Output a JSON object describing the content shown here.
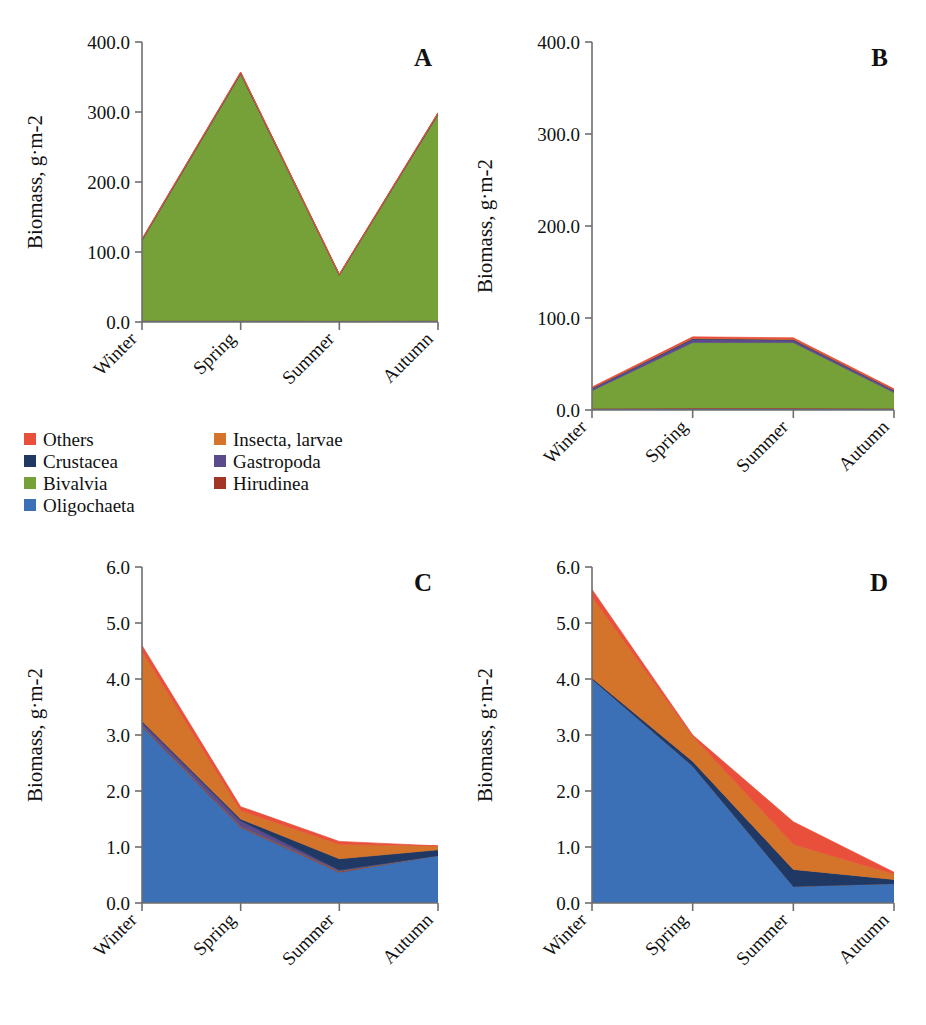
{
  "figure": {
    "kind": "multi-panel-stacked-area-figure",
    "panel_count": 4,
    "y_axis_title": "Biomass, g·m-2",
    "categories": [
      "Winter",
      "Spring",
      "Summer",
      "Autumn"
    ]
  },
  "legend": {
    "position": "center-left, between top and bottom panel rows",
    "columns": 2,
    "items": [
      {
        "label": "Others",
        "color": "#E8503C"
      },
      {
        "label": "Insecta, larvae",
        "color": "#D4742B"
      },
      {
        "label": "Crustacea",
        "color": "#1F3864"
      },
      {
        "label": "Gastropoda",
        "color": "#5B4A8C"
      },
      {
        "label": "Bivalvia",
        "color": "#76A038"
      },
      {
        "label": "Hirudinea",
        "color": "#A33527"
      },
      {
        "label": "Oligochaeta",
        "color": "#3B6FB6"
      }
    ]
  },
  "panels": [
    {
      "id": "A",
      "letter": "A"
    },
    {
      "id": "B",
      "letter": "B"
    },
    {
      "id": "C",
      "letter": "C"
    },
    {
      "id": "D",
      "letter": "D"
    }
  ],
  "chart_data": [
    {
      "panel": "A",
      "type": "area",
      "stacked": true,
      "title": "A",
      "xlabel": "",
      "ylabel": "Biomass, g·m-2",
      "categories": [
        "Winter",
        "Spring",
        "Summer",
        "Autumn"
      ],
      "ylim": [
        0,
        400
      ],
      "yticks": [
        0,
        100,
        200,
        300,
        400
      ],
      "ytick_labels": [
        "0.0",
        "100.0",
        "200.0",
        "300.0",
        "400.0"
      ],
      "grid": false,
      "legend_shared": true,
      "series": [
        {
          "name": "Oligochaeta",
          "color": "#3B6FB6",
          "values": [
            2.0,
            2.0,
            1.5,
            2.0
          ]
        },
        {
          "name": "Hirudinea",
          "color": "#A33527",
          "values": [
            0.3,
            0.3,
            0.2,
            0.3
          ]
        },
        {
          "name": "Bivalvia",
          "color": "#76A038",
          "values": [
            114.0,
            352.0,
            65.0,
            294.0
          ]
        },
        {
          "name": "Gastropoda",
          "color": "#5B4A8C",
          "values": [
            1.2,
            1.5,
            0.8,
            1.5
          ]
        },
        {
          "name": "Crustacea",
          "color": "#1F3864",
          "values": [
            0.3,
            0.3,
            0.2,
            0.3
          ]
        },
        {
          "name": "Insecta, larvae",
          "color": "#D4742B",
          "values": [
            0.6,
            0.6,
            0.4,
            0.6
          ]
        },
        {
          "name": "Others",
          "color": "#E8503C",
          "values": [
            0.3,
            0.3,
            0.2,
            0.3
          ]
        }
      ],
      "totals": [
        118.7,
        357.0,
        68.3,
        298.7
      ]
    },
    {
      "panel": "B",
      "type": "area",
      "stacked": true,
      "title": "B",
      "xlabel": "",
      "ylabel": "Biomass, g·m-2",
      "categories": [
        "Winter",
        "Spring",
        "Summer",
        "Autumn"
      ],
      "ylim": [
        0,
        400
      ],
      "yticks": [
        0,
        100,
        200,
        300,
        400
      ],
      "ytick_labels": [
        "0.0",
        "100.0",
        "200.0",
        "300.0",
        "400.0"
      ],
      "grid": false,
      "legend_shared": true,
      "series": [
        {
          "name": "Oligochaeta",
          "color": "#3B6FB6",
          "values": [
            1.5,
            1.5,
            1.5,
            1.5
          ]
        },
        {
          "name": "Hirudinea",
          "color": "#A33527",
          "values": [
            0.5,
            0.8,
            0.8,
            0.5
          ]
        },
        {
          "name": "Bivalvia",
          "color": "#76A038",
          "values": [
            19.0,
            71.0,
            71.0,
            17.0
          ]
        },
        {
          "name": "Gastropoda",
          "color": "#5B4A8C",
          "values": [
            2.5,
            4.0,
            3.0,
            2.5
          ]
        },
        {
          "name": "Crustacea",
          "color": "#1F3864",
          "values": [
            0.3,
            0.4,
            0.4,
            0.3
          ]
        },
        {
          "name": "Insecta, larvae",
          "color": "#D4742B",
          "values": [
            0.4,
            0.6,
            0.6,
            0.4
          ]
        },
        {
          "name": "Others",
          "color": "#E8503C",
          "values": [
            0.8,
            1.2,
            1.2,
            0.8
          ]
        }
      ],
      "totals": [
        25.0,
        79.5,
        78.5,
        23.0
      ]
    },
    {
      "panel": "C",
      "type": "area",
      "stacked": true,
      "title": "C",
      "xlabel": "",
      "ylabel": "Biomass, g·m-2",
      "categories": [
        "Winter",
        "Spring",
        "Summer",
        "Autumn"
      ],
      "ylim": [
        0,
        6
      ],
      "yticks": [
        0,
        1,
        2,
        3,
        4,
        5,
        6
      ],
      "ytick_labels": [
        "0.0",
        "1.0",
        "2.0",
        "3.0",
        "4.0",
        "5.0",
        "6.0"
      ],
      "grid": false,
      "legend_shared": true,
      "series": [
        {
          "name": "Oligochaeta",
          "color": "#3B6FB6",
          "values": [
            3.15,
            1.35,
            0.55,
            0.85
          ]
        },
        {
          "name": "Hirudinea",
          "color": "#A33527",
          "values": [
            0.02,
            0.02,
            0.02,
            0.0
          ]
        },
        {
          "name": "Bivalvia",
          "color": "#76A038",
          "values": [
            0.0,
            0.0,
            0.0,
            0.0
          ]
        },
        {
          "name": "Gastropoda",
          "color": "#5B4A8C",
          "values": [
            0.06,
            0.1,
            0.02,
            0.0
          ]
        },
        {
          "name": "Crustacea",
          "color": "#1F3864",
          "values": [
            0.02,
            0.03,
            0.2,
            0.1
          ]
        },
        {
          "name": "Insecta, larvae",
          "color": "#D4742B",
          "values": [
            1.25,
            0.15,
            0.26,
            0.07
          ]
        },
        {
          "name": "Others",
          "color": "#E8503C",
          "values": [
            0.1,
            0.07,
            0.05,
            0.0
          ]
        }
      ],
      "totals": [
        4.6,
        1.72,
        1.1,
        1.02
      ]
    },
    {
      "panel": "D",
      "type": "area",
      "stacked": true,
      "title": "D",
      "xlabel": "",
      "ylabel": "Biomass, g·m-2",
      "categories": [
        "Winter",
        "Spring",
        "Summer",
        "Autumn"
      ],
      "ylim": [
        0,
        6
      ],
      "yticks": [
        0,
        1,
        2,
        3,
        4,
        5,
        6
      ],
      "ytick_labels": [
        "0.0",
        "1.0",
        "2.0",
        "3.0",
        "4.0",
        "5.0",
        "6.0"
      ],
      "grid": false,
      "legend_shared": true,
      "series": [
        {
          "name": "Oligochaeta",
          "color": "#3B6FB6",
          "values": [
            4.0,
            2.45,
            0.3,
            0.35
          ]
        },
        {
          "name": "Hirudinea",
          "color": "#A33527",
          "values": [
            0.0,
            0.0,
            0.0,
            0.0
          ]
        },
        {
          "name": "Bivalvia",
          "color": "#76A038",
          "values": [
            0.0,
            0.0,
            0.0,
            0.0
          ]
        },
        {
          "name": "Gastropoda",
          "color": "#5B4A8C",
          "values": [
            0.0,
            0.0,
            0.0,
            0.0
          ]
        },
        {
          "name": "Crustacea",
          "color": "#1F3864",
          "values": [
            0.02,
            0.08,
            0.3,
            0.07
          ]
        },
        {
          "name": "Insecta, larvae",
          "color": "#D4742B",
          "values": [
            1.45,
            0.45,
            0.45,
            0.1
          ]
        },
        {
          "name": "Others",
          "color": "#E8503C",
          "values": [
            0.13,
            0.02,
            0.4,
            0.03
          ]
        }
      ],
      "totals": [
        5.6,
        3.0,
        1.45,
        0.55
      ]
    }
  ]
}
